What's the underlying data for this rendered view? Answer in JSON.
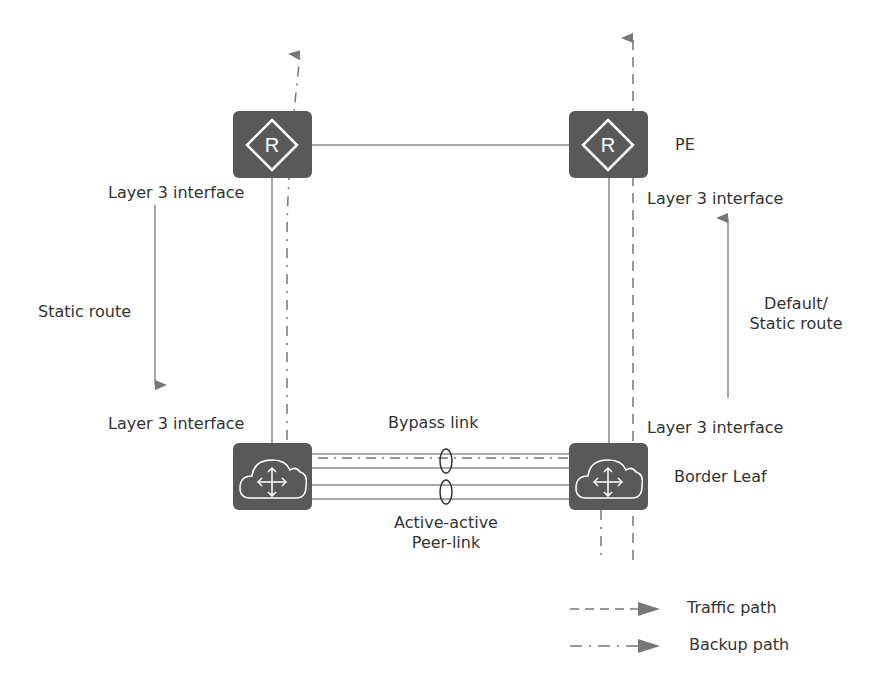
{
  "colors": {
    "device": "#595959",
    "line": "#8a8a8a",
    "path": "#777777",
    "arrow": "#777777",
    "text": "#333333",
    "icon": "#ffffff"
  },
  "devices": {
    "pe_left": {
      "label": "",
      "icon": "router-icon",
      "glyph": "R"
    },
    "pe_right": {
      "label": "PE",
      "icon": "router-icon",
      "glyph": "R"
    },
    "leaf_left": {
      "label": "",
      "icon": "cloud-switch-icon"
    },
    "leaf_right": {
      "label": "Border Leaf",
      "icon": "cloud-switch-icon"
    }
  },
  "labels": {
    "left_top_interface": "Layer 3 interface",
    "left_bottom_interface": "Layer 3 interface",
    "right_top_interface": "Layer 3 interface",
    "right_bottom_interface": "Layer 3 interface",
    "static_route": "Static route",
    "default_static_route_line1": "Default/",
    "default_static_route_line2": "Static route",
    "bypass_link": "Bypass link",
    "peer_link_line1": "Active-active",
    "peer_link_line2": "Peer-link"
  },
  "legend": {
    "items": [
      {
        "label": "Traffic path",
        "style": "dashed"
      },
      {
        "label": "Backup path",
        "style": "dash-dot"
      }
    ]
  }
}
